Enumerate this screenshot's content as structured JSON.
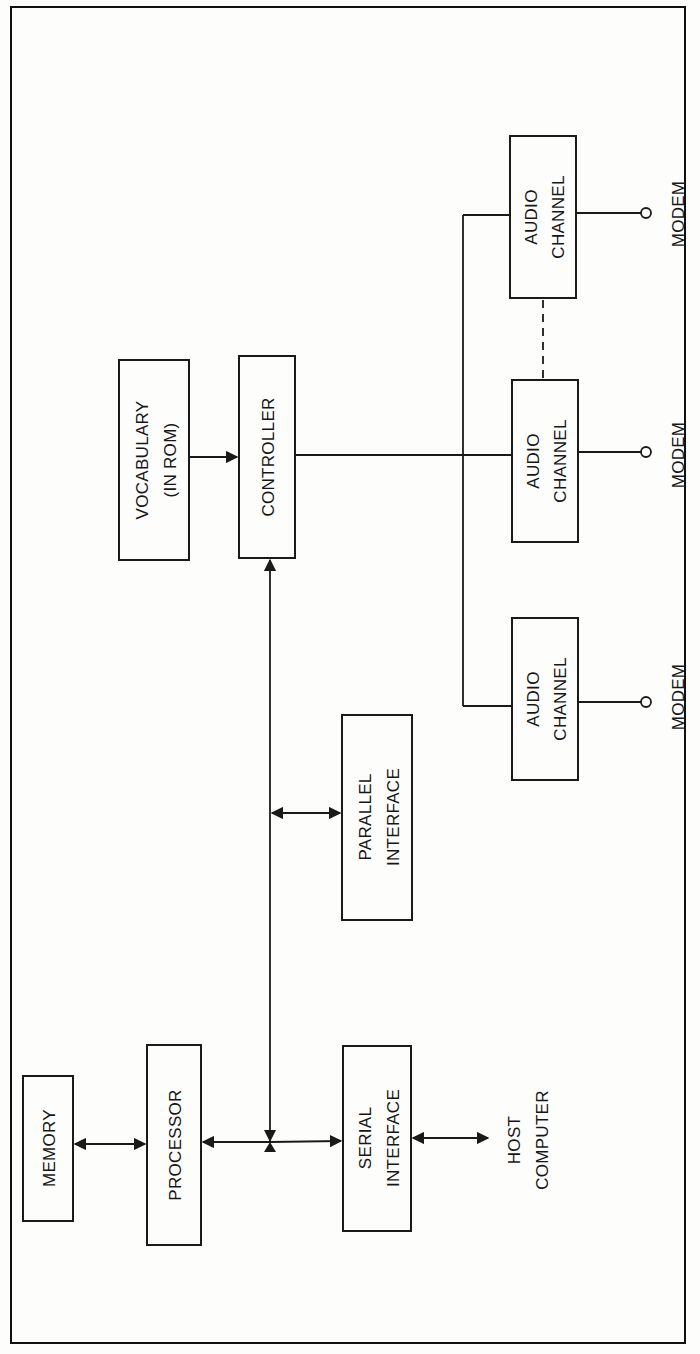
{
  "diagram": {
    "orientation": "rotated-90-ccw",
    "blocks": {
      "memory": {
        "label": "MEMORY"
      },
      "processor": {
        "label": "PROCESSOR"
      },
      "serial_interface": {
        "line1": "SERIAL",
        "line2": "INTERFACE"
      },
      "parallel_interface": {
        "line1": "PARALLEL",
        "line2": "INTERFACE"
      },
      "vocabulary": {
        "line1": "VOCABULARY",
        "line2": "(IN ROM)"
      },
      "controller": {
        "label": "CONTROLLER"
      },
      "audio_channel_1": {
        "line1": "AUDIO",
        "line2": "CHANNEL"
      },
      "audio_channel_2": {
        "line1": "AUDIO",
        "line2": "CHANNEL"
      },
      "audio_channel_3": {
        "line1": "AUDIO",
        "line2": "CHANNEL"
      }
    },
    "terminals": {
      "host": {
        "line1": "HOST",
        "line2": "COMPUTER"
      },
      "modem_1": {
        "label": "MODEM"
      },
      "modem_2": {
        "label": "MODEM"
      },
      "modem_3": {
        "label": "MODEM"
      }
    },
    "connections": [
      {
        "from": "MEMORY",
        "to": "PROCESSOR",
        "type": "bidirectional"
      },
      {
        "from": "PROCESSOR",
        "to": "bus",
        "type": "bidirectional"
      },
      {
        "from": "bus",
        "to": "SERIAL INTERFACE",
        "type": "arrow"
      },
      {
        "from": "SERIAL INTERFACE",
        "to": "HOST COMPUTER",
        "type": "bidirectional"
      },
      {
        "from": "bus",
        "to": "PARALLEL INTERFACE",
        "type": "bidirectional"
      },
      {
        "from": "bus",
        "to": "CONTROLLER",
        "type": "arrow"
      },
      {
        "from": "VOCABULARY (IN ROM)",
        "to": "CONTROLLER",
        "type": "arrow"
      },
      {
        "from": "CONTROLLER",
        "to": "AUDIO CHANNEL x3",
        "type": "line"
      },
      {
        "from": "AUDIO CHANNEL",
        "to": "MODEM",
        "type": "line-terminal"
      },
      {
        "from": "AUDIO CHANNEL",
        "to": "AUDIO CHANNEL",
        "type": "dashed"
      }
    ]
  }
}
